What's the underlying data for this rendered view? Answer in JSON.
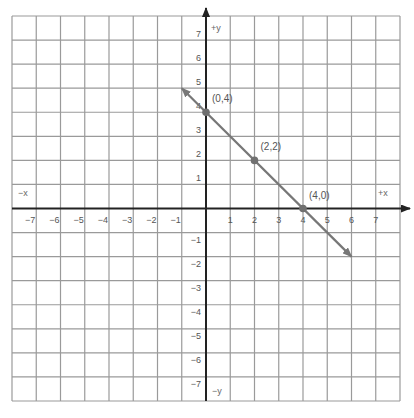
{
  "chart_data": {
    "type": "line",
    "title": "",
    "xlabel": "x",
    "ylabel": "y",
    "xlim": [
      -8,
      8
    ],
    "ylim": [
      -8,
      8
    ],
    "grid": true,
    "axis_labels": {
      "pos_x": "+x",
      "neg_x": "−x",
      "pos_y": "+y",
      "neg_y": "−y"
    },
    "x_ticks": [
      -7,
      -6,
      -5,
      -4,
      -3,
      -2,
      -1,
      1,
      2,
      3,
      4,
      5,
      6,
      7
    ],
    "y_ticks": [
      -7,
      -6,
      -5,
      -4,
      -3,
      -2,
      -1,
      1,
      2,
      3,
      4,
      5,
      6,
      7
    ],
    "series": [
      {
        "name": "line x + y = 4",
        "x": [
          -1,
          6
        ],
        "y": [
          5,
          -2
        ],
        "arrows": "both",
        "color": "#777777"
      }
    ],
    "points": [
      {
        "x": 0,
        "y": 4,
        "label": "(0,4)"
      },
      {
        "x": 2,
        "y": 2,
        "label": "(2,2)"
      },
      {
        "x": 4,
        "y": 0,
        "label": "(4,0)"
      }
    ],
    "colors": {
      "grid": "#9a9a9a",
      "axis": "#222222",
      "line": "#777777",
      "point": "#707070"
    }
  }
}
